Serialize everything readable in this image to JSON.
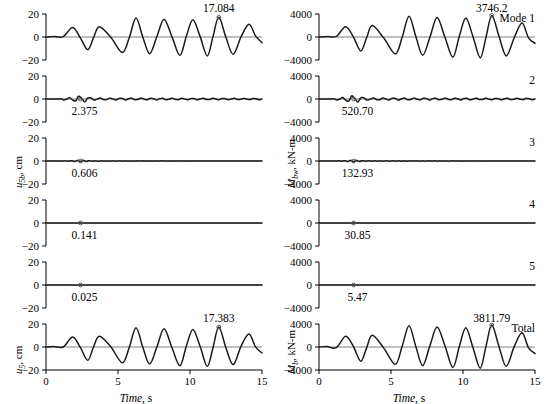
{
  "figure": {
    "width": 545,
    "height": 402,
    "background": "#ffffff",
    "line_color": "#1a1a1a",
    "axis_color": "#000000",
    "zero_line_color": "#808080",
    "marker_color": "#555555"
  },
  "chart_data": {
    "type": "line",
    "title": "",
    "layout": "2 columns x 6 stacked time-history panels",
    "xlabel": "Time, s",
    "x": {
      "min": 0,
      "max": 15,
      "ticks": [
        0,
        5,
        10,
        15
      ],
      "tick_labels": [
        "0",
        "5",
        "10",
        "15"
      ]
    },
    "columns": [
      {
        "name": "left",
        "ylabel_parts": {
          "symbol": "u",
          "subscript": "5b",
          "unit": ", cm"
        },
        "ylabel_plain": "u5b, cm",
        "ylabel_bottom_parts": {
          "symbol": "u",
          "subscript": "5",
          "unit": ", cm"
        },
        "ylabel_bottom_plain": "u5, cm",
        "y": {
          "min": -20,
          "max": 20,
          "ticks": [
            20,
            0,
            -20
          ],
          "tick_labels": [
            "20",
            "0",
            "−20"
          ]
        },
        "panels": [
          {
            "id": "L1",
            "mode_label": "Mode 1",
            "mode_label_visible": false,
            "peak_value": "17.084",
            "peak_numeric": 17.084,
            "peak_time": 12.0,
            "peak_label_position": "above",
            "amplitude": 17.084,
            "marker_shown": true,
            "waveform": "large",
            "series": {
              "description": "Modal displacement response of mode 1, dominant low-frequency oscillation",
              "peak_points": [
                {
                  "t": 1.85,
                  "v": 8.2
                },
                {
                  "t": 2.9,
                  "v": -11.0
                },
                {
                  "t": 3.7,
                  "v": 9.0
                },
                {
                  "t": 5.3,
                  "v": -13.5
                },
                {
                  "t": 6.25,
                  "v": 16.5
                },
                {
                  "t": 7.2,
                  "v": -14.5
                },
                {
                  "t": 8.2,
                  "v": 15.5
                },
                {
                  "t": 9.3,
                  "v": -16.0
                },
                {
                  "t": 10.2,
                  "v": 15.0
                },
                {
                  "t": 11.2,
                  "v": -16.5
                },
                {
                  "t": 12.0,
                  "v": 17.084
                },
                {
                  "t": 13.0,
                  "v": -15.0
                },
                {
                  "t": 14.1,
                  "v": 11.0
                },
                {
                  "t": 15.0,
                  "v": -5.0
                }
              ]
            }
          },
          {
            "id": "L2",
            "mode_label": "2",
            "mode_label_visible": false,
            "peak_value": "2.375",
            "peak_numeric": 2.375,
            "peak_time": 2.4,
            "peak_label_position": "below",
            "amplitude": 2.375,
            "marker_shown": true,
            "waveform": "ripple-fast",
            "series": {
              "description": "Mode 2 response: small fast ripple about zero",
              "frequency_hz": 1.4,
              "envelope_peak": 2.375
            }
          },
          {
            "id": "L3",
            "mode_label": "3",
            "mode_label_visible": false,
            "peak_value": "0.606",
            "peak_numeric": 0.606,
            "peak_time": 2.4,
            "peak_label_position": "below",
            "amplitude": 0.606,
            "marker_shown": true,
            "waveform": "ripple-tiny",
            "series": {
              "description": "Mode 3 response: very small ripple, nearly flat",
              "frequency_hz": 2.4,
              "envelope_peak": 0.606
            }
          },
          {
            "id": "L4",
            "mode_label": "4",
            "mode_label_visible": false,
            "peak_value": "0.141",
            "peak_numeric": 0.141,
            "peak_time": 2.4,
            "peak_label_position": "below",
            "amplitude": 0.141,
            "marker_shown": true,
            "waveform": "flat",
            "series": {
              "description": "Mode 4 response: essentially flat at zero",
              "envelope_peak": 0.141
            }
          },
          {
            "id": "L5",
            "mode_label": "5",
            "mode_label_visible": false,
            "peak_value": "0.025",
            "peak_numeric": 0.025,
            "peak_time": 2.4,
            "peak_label_position": "below",
            "amplitude": 0.025,
            "marker_shown": true,
            "waveform": "flat",
            "series": {
              "description": "Mode 5 response: flat at zero",
              "envelope_peak": 0.025
            }
          },
          {
            "id": "L6",
            "mode_label": "Total",
            "mode_label_visible": false,
            "peak_value": "17.383",
            "peak_numeric": 17.383,
            "peak_time": 12.0,
            "peak_label_position": "above",
            "amplitude": 17.383,
            "marker_shown": true,
            "waveform": "large",
            "has_xaxis": true,
            "series": {
              "description": "Total displacement response, sum of all modes",
              "peak_points": [
                {
                  "t": 1.85,
                  "v": 8.6
                },
                {
                  "t": 2.9,
                  "v": -11.5
                },
                {
                  "t": 3.7,
                  "v": 9.4
                },
                {
                  "t": 5.3,
                  "v": -13.8
                },
                {
                  "t": 6.25,
                  "v": 16.8
                },
                {
                  "t": 7.2,
                  "v": -14.8
                },
                {
                  "t": 8.2,
                  "v": 15.8
                },
                {
                  "t": 9.3,
                  "v": -16.3
                },
                {
                  "t": 10.2,
                  "v": 15.3
                },
                {
                  "t": 11.2,
                  "v": -16.8
                },
                {
                  "t": 12.0,
                  "v": 17.383
                },
                {
                  "t": 13.0,
                  "v": -15.3
                },
                {
                  "t": 14.1,
                  "v": 11.3
                },
                {
                  "t": 15.0,
                  "v": -5.2
                }
              ]
            }
          }
        ]
      },
      {
        "name": "right",
        "ylabel_parts": {
          "symbol": "M",
          "subscript": "bw",
          "unit": ", kN-m"
        },
        "ylabel_plain": "Mbw, kN-m",
        "ylabel_bottom_parts": {
          "symbol": "M",
          "subscript": "b",
          "unit": ", kN-m"
        },
        "ylabel_bottom_plain": "Mb, kN-m",
        "y": {
          "min": -4000,
          "max": 4000,
          "ticks": [
            4000,
            0,
            -4000
          ],
          "tick_labels": [
            "4000",
            "0",
            "−4000"
          ]
        },
        "panels": [
          {
            "id": "R1",
            "mode_label": "Mode 1",
            "mode_label_visible": true,
            "peak_value": "3746.2",
            "peak_numeric": 3746.2,
            "peak_time": 12.0,
            "peak_label_position": "above",
            "amplitude": 3746.2,
            "marker_shown": true,
            "waveform": "large",
            "series": {
              "description": "Modal base moment of mode 1",
              "peak_points": [
                {
                  "t": 1.85,
                  "v": 1800
                },
                {
                  "t": 2.9,
                  "v": -2420
                },
                {
                  "t": 3.7,
                  "v": 1980
                },
                {
                  "t": 5.3,
                  "v": -2960
                },
                {
                  "t": 6.25,
                  "v": 3620
                },
                {
                  "t": 7.2,
                  "v": -3180
                },
                {
                  "t": 8.2,
                  "v": 3400
                },
                {
                  "t": 9.3,
                  "v": -3510
                },
                {
                  "t": 10.2,
                  "v": 3290
                },
                {
                  "t": 11.2,
                  "v": -3620
                },
                {
                  "t": 12.0,
                  "v": 3746.2
                },
                {
                  "t": 13.0,
                  "v": -3290
                },
                {
                  "t": 14.1,
                  "v": 2420
                },
                {
                  "t": 15.0,
                  "v": -1100
                }
              ]
            }
          },
          {
            "id": "R2",
            "mode_label": "2",
            "mode_label_visible": true,
            "peak_value": "520.70",
            "peak_numeric": 520.7,
            "peak_time": 2.4,
            "peak_label_position": "below",
            "amplitude": 520.7,
            "marker_shown": true,
            "waveform": "ripple-fast",
            "series": {
              "description": "Mode 2 base moment: small fast ripple",
              "frequency_hz": 1.4,
              "envelope_peak": 520.7
            }
          },
          {
            "id": "R3",
            "mode_label": "3",
            "mode_label_visible": true,
            "peak_value": "132.93",
            "peak_numeric": 132.93,
            "peak_time": 2.4,
            "peak_label_position": "below",
            "amplitude": 132.93,
            "marker_shown": true,
            "waveform": "ripple-tiny",
            "series": {
              "description": "Mode 3 base moment: very small ripple",
              "frequency_hz": 2.4,
              "envelope_peak": 132.93
            }
          },
          {
            "id": "R4",
            "mode_label": "4",
            "mode_label_visible": true,
            "peak_value": "30.85",
            "peak_numeric": 30.85,
            "peak_time": 2.4,
            "peak_label_position": "below",
            "amplitude": 30.85,
            "marker_shown": true,
            "waveform": "flat",
            "series": {
              "description": "Mode 4 base moment: flat at zero",
              "envelope_peak": 30.85
            }
          },
          {
            "id": "R5",
            "mode_label": "5",
            "mode_label_visible": true,
            "peak_value": "5.47",
            "peak_numeric": 5.47,
            "peak_time": 2.4,
            "peak_label_position": "below",
            "amplitude": 5.47,
            "marker_shown": true,
            "waveform": "flat",
            "series": {
              "description": "Mode 5 base moment: flat at zero",
              "envelope_peak": 5.47
            }
          },
          {
            "id": "R6",
            "mode_label": "Total",
            "mode_label_visible": true,
            "peak_value": "3811.79",
            "peak_numeric": 3811.79,
            "peak_time": 12.0,
            "peak_label_position": "above",
            "amplitude": 3811.79,
            "marker_shown": true,
            "waveform": "large",
            "has_xaxis": true,
            "series": {
              "description": "Total base moment, sum of all modes",
              "peak_points": [
                {
                  "t": 1.85,
                  "v": 1850
                },
                {
                  "t": 2.9,
                  "v": -2480
                },
                {
                  "t": 3.7,
                  "v": 2030
                },
                {
                  "t": 5.3,
                  "v": -3020
                },
                {
                  "t": 6.25,
                  "v": 3680
                },
                {
                  "t": 7.2,
                  "v": -3240
                },
                {
                  "t": 8.2,
                  "v": 3460
                },
                {
                  "t": 9.3,
                  "v": -3570
                },
                {
                  "t": 10.2,
                  "v": 3350
                },
                {
                  "t": 11.2,
                  "v": -3680
                },
                {
                  "t": 12.0,
                  "v": 3811.79
                },
                {
                  "t": 13.0,
                  "v": -3350
                },
                {
                  "t": 14.1,
                  "v": 2480
                },
                {
                  "t": 15.0,
                  "v": -1150
                }
              ]
            }
          }
        ]
      }
    ]
  }
}
